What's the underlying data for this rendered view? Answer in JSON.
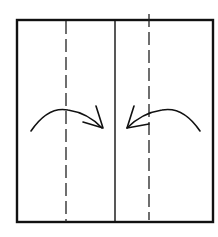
{
  "diagram": {
    "type": "origami-fold-instruction",
    "colors": {
      "line": "#111111",
      "background": "#ffffff"
    },
    "paper": {
      "x": 17,
      "y": 20,
      "width": 196,
      "height": 202,
      "stroke_width": 2.4
    },
    "center_crease": {
      "x": 115,
      "y1": 20,
      "y2": 222,
      "style": "solid",
      "meaning": "center line (existing crease)"
    },
    "fold_lines": [
      {
        "id": "left-valley-fold",
        "x": 66,
        "y1": 20,
        "y2": 222,
        "style": "dashed",
        "meaning": "valley fold"
      },
      {
        "id": "right-valley-fold",
        "x": 149,
        "y1": 14,
        "y2": 220,
        "style": "dashed",
        "meaning": "valley fold"
      }
    ],
    "arrows": [
      {
        "id": "left-fold-arrow",
        "direction": "right",
        "meaning": "fold left edge to center"
      },
      {
        "id": "right-fold-arrow",
        "direction": "left",
        "meaning": "fold right edge to center"
      }
    ]
  }
}
